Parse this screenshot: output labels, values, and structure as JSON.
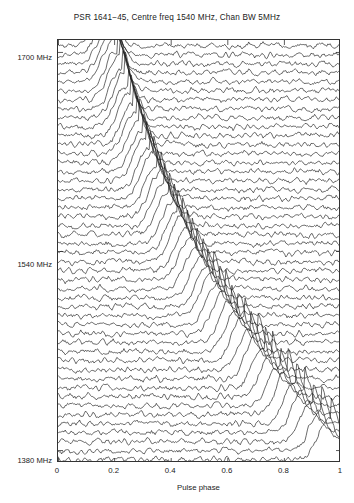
{
  "chart_data": {
    "type": "line",
    "title": "PSR 1641−45, Centre freq 1540 MHz, Chan BW 5MHz",
    "xlabel": "Pulse phase",
    "ylabel": "",
    "xlim": [
      0,
      1
    ],
    "xticks": [
      "0",
      "0.2",
      "0.4",
      "0.6",
      "0.8",
      "1"
    ],
    "xtick_values": [
      0,
      0.2,
      0.4,
      0.6,
      0.8,
      1
    ],
    "yticklabels": [
      "1700 MHz",
      "1540 MHz",
      "1380 MHz"
    ],
    "ytick_values": [
      1700,
      1540,
      1380
    ],
    "ylim": [
      1370,
      1710
    ],
    "grid": false,
    "legend": null,
    "n_traces": 47,
    "trace_description": "Stacked single-pulse profiles, one per 5 MHz frequency channel; each trace is receiver noise plus a dispersed pulse whose arrival phase drifts later at lower frequency.",
    "series": [
      {
        "name": "1702 MHz",
        "channel": 0,
        "peak_phase": 0.175,
        "peak_amplitude": 1.0
      },
      {
        "name": "1695 MHz",
        "channel": 1,
        "peak_phase": 0.181,
        "peak_amplitude": 0.97
      },
      {
        "name": "1688 MHz",
        "channel": 2,
        "peak_phase": 0.188,
        "peak_amplitude": 1.02
      },
      {
        "name": "1681 MHz",
        "channel": 3,
        "peak_phase": 0.195,
        "peak_amplitude": 0.95
      },
      {
        "name": "1674 MHz",
        "channel": 4,
        "peak_phase": 0.203,
        "peak_amplitude": 1.05
      },
      {
        "name": "1667 MHz",
        "channel": 5,
        "peak_phase": 0.211,
        "peak_amplitude": 0.98
      },
      {
        "name": "1660 MHz",
        "channel": 6,
        "peak_phase": 0.219,
        "peak_amplitude": 1.01
      },
      {
        "name": "1653 MHz",
        "channel": 7,
        "peak_phase": 0.228,
        "peak_amplitude": 0.93
      },
      {
        "name": "1646 MHz",
        "channel": 8,
        "peak_phase": 0.237,
        "peak_amplitude": 1.06
      },
      {
        "name": "1639 MHz",
        "channel": 9,
        "peak_phase": 0.246,
        "peak_amplitude": 0.99
      },
      {
        "name": "1632 MHz",
        "channel": 10,
        "peak_phase": 0.256,
        "peak_amplitude": 1.03
      },
      {
        "name": "1625 MHz",
        "channel": 11,
        "peak_phase": 0.266,
        "peak_amplitude": 0.96
      },
      {
        "name": "1618 MHz",
        "channel": 12,
        "peak_phase": 0.277,
        "peak_amplitude": 1.0
      },
      {
        "name": "1611 MHz",
        "channel": 13,
        "peak_phase": 0.288,
        "peak_amplitude": 1.04
      },
      {
        "name": "1604 MHz",
        "channel": 14,
        "peak_phase": 0.299,
        "peak_amplitude": 0.94
      },
      {
        "name": "1597 MHz",
        "channel": 15,
        "peak_phase": 0.311,
        "peak_amplitude": 1.02
      },
      {
        "name": "1590 MHz",
        "channel": 16,
        "peak_phase": 0.323,
        "peak_amplitude": 0.98
      },
      {
        "name": "1583 MHz",
        "channel": 17,
        "peak_phase": 0.336,
        "peak_amplitude": 1.05
      },
      {
        "name": "1576 MHz",
        "channel": 18,
        "peak_phase": 0.349,
        "peak_amplitude": 0.97
      },
      {
        "name": "1569 MHz",
        "channel": 19,
        "peak_phase": 0.363,
        "peak_amplitude": 1.01
      },
      {
        "name": "1562 MHz",
        "channel": 20,
        "peak_phase": 0.377,
        "peak_amplitude": 0.99
      },
      {
        "name": "1555 MHz",
        "channel": 21,
        "peak_phase": 0.392,
        "peak_amplitude": 1.03
      },
      {
        "name": "1548 MHz",
        "channel": 22,
        "peak_phase": 0.407,
        "peak_amplitude": 0.95
      },
      {
        "name": "1541 MHz",
        "channel": 23,
        "peak_phase": 0.423,
        "peak_amplitude": 1.0
      },
      {
        "name": "1534 MHz",
        "channel": 24,
        "peak_phase": 0.439,
        "peak_amplitude": 1.04
      },
      {
        "name": "1527 MHz",
        "channel": 25,
        "peak_phase": 0.456,
        "peak_amplitude": 0.96
      },
      {
        "name": "1520 MHz",
        "channel": 26,
        "peak_phase": 0.473,
        "peak_amplitude": 1.02
      },
      {
        "name": "1513 MHz",
        "channel": 27,
        "peak_phase": 0.491,
        "peak_amplitude": 0.98
      },
      {
        "name": "1506 MHz",
        "channel": 28,
        "peak_phase": 0.51,
        "peak_amplitude": 1.01
      },
      {
        "name": "1499 MHz",
        "channel": 29,
        "peak_phase": 0.529,
        "peak_amplitude": 0.94
      },
      {
        "name": "1492 MHz",
        "channel": 30,
        "peak_phase": 0.549,
        "peak_amplitude": 1.05
      },
      {
        "name": "1485 MHz",
        "channel": 31,
        "peak_phase": 0.569,
        "peak_amplitude": 0.99
      },
      {
        "name": "1478 MHz",
        "channel": 32,
        "peak_phase": 0.59,
        "peak_amplitude": 1.03
      },
      {
        "name": "1471 MHz",
        "channel": 33,
        "peak_phase": 0.612,
        "peak_amplitude": 0.97
      },
      {
        "name": "1464 MHz",
        "channel": 34,
        "peak_phase": 0.635,
        "peak_amplitude": 1.0
      },
      {
        "name": "1457 MHz",
        "channel": 35,
        "peak_phase": 0.658,
        "peak_amplitude": 1.04
      },
      {
        "name": "1450 MHz",
        "channel": 36,
        "peak_phase": 0.682,
        "peak_amplitude": 0.96
      },
      {
        "name": "1443 MHz",
        "channel": 37,
        "peak_phase": 0.706,
        "peak_amplitude": 1.02
      },
      {
        "name": "1436 MHz",
        "channel": 38,
        "peak_phase": 0.732,
        "peak_amplitude": 0.98
      },
      {
        "name": "1429 MHz",
        "channel": 39,
        "peak_phase": 0.758,
        "peak_amplitude": 1.01
      },
      {
        "name": "1422 MHz",
        "channel": 40,
        "peak_phase": 0.785,
        "peak_amplitude": 0.95
      },
      {
        "name": "1415 MHz",
        "channel": 41,
        "peak_phase": 0.813,
        "peak_amplitude": 1.05
      },
      {
        "name": "1408 MHz",
        "channel": 42,
        "peak_phase": 0.841,
        "peak_amplitude": 0.99
      },
      {
        "name": "1401 MHz",
        "channel": 43,
        "peak_phase": 0.871,
        "peak_amplitude": 1.03
      },
      {
        "name": "1394 MHz",
        "channel": 44,
        "peak_phase": 0.901,
        "peak_amplitude": 0.97
      },
      {
        "name": "1387 MHz",
        "channel": 45,
        "peak_phase": 0.932,
        "peak_amplitude": 1.01
      },
      {
        "name": "1380 MHz",
        "channel": 46,
        "peak_phase": 0.964,
        "peak_amplitude": 1.0
      }
    ]
  },
  "style": {
    "line_color": "#1a1a1a",
    "axis_color": "#333333",
    "background": "#ffffff"
  }
}
